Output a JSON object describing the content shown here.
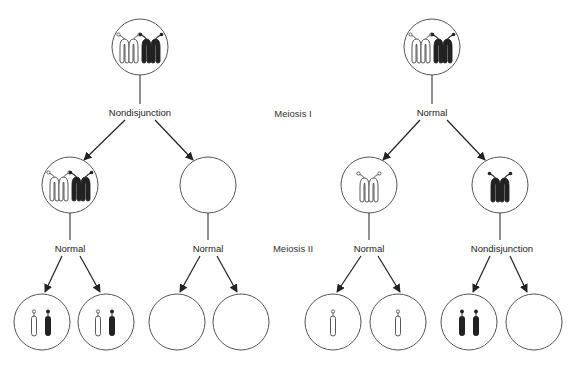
{
  "stages": {
    "meiosis1": "Meiosis I",
    "meiosis2": "Meiosis II"
  },
  "left_panel": {
    "meiosis1_event": "Nondisjunction",
    "meiosis2_event_a": "Normal",
    "meiosis2_event_b": "Normal",
    "gametes": [
      {
        "chromosomes": [
          "white",
          "black"
        ]
      },
      {
        "chromosomes": [
          "white",
          "black"
        ]
      },
      {
        "chromosomes": []
      },
      {
        "chromosomes": []
      }
    ]
  },
  "right_panel": {
    "meiosis1_event": "Normal",
    "meiosis2_event_a": "Normal",
    "meiosis2_event_b": "Nondisjunction",
    "gametes": [
      {
        "chromosomes": [
          "white"
        ]
      },
      {
        "chromosomes": [
          "white"
        ]
      },
      {
        "chromosomes": [
          "black",
          "black"
        ]
      },
      {
        "chromosomes": []
      }
    ]
  },
  "colors": {
    "line": "#222222",
    "circle_stroke": "#555555",
    "chromosome_dark": "#222222",
    "chromosome_light": "#ffffff"
  }
}
